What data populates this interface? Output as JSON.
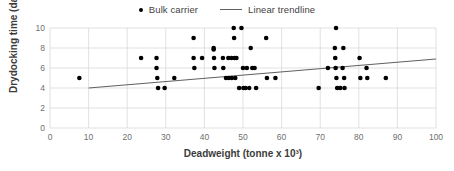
{
  "chart_data": {
    "type": "scatter",
    "title": "",
    "xlabel": "Deadweight (tonne x 10³)",
    "ylabel": "Drydocking time (day)",
    "xlim": [
      0,
      100
    ],
    "ylim": [
      0,
      10
    ],
    "xticks": [
      0,
      10,
      20,
      30,
      40,
      50,
      60,
      70,
      80,
      90,
      100
    ],
    "yticks": [
      0,
      2,
      4,
      6,
      8,
      10
    ],
    "grid": true,
    "legend_position": "top-center",
    "legend": [
      {
        "label": "Bulk carrier",
        "marker": "dot",
        "color": "#000000"
      },
      {
        "label": "Linear trendline",
        "marker": "line",
        "color": "#606060"
      }
    ],
    "series": [
      {
        "name": "Bulk carrier",
        "marker": "dot",
        "color": "#000000",
        "points": [
          [
            7.6,
            5
          ],
          [
            23.6,
            7
          ],
          [
            27.6,
            7
          ],
          [
            27.6,
            6
          ],
          [
            27.8,
            5
          ],
          [
            28.0,
            4
          ],
          [
            29.7,
            4
          ],
          [
            32.2,
            5
          ],
          [
            37.2,
            9
          ],
          [
            37.2,
            7
          ],
          [
            37.4,
            6
          ],
          [
            39.4,
            7
          ],
          [
            42.4,
            8
          ],
          [
            42.4,
            7.85
          ],
          [
            42.5,
            7
          ],
          [
            42.6,
            6
          ],
          [
            44.8,
            7
          ],
          [
            44.9,
            6
          ],
          [
            45.6,
            5
          ],
          [
            46.2,
            7
          ],
          [
            46.3,
            5
          ],
          [
            47.0,
            7
          ],
          [
            47.1,
            5
          ],
          [
            47.6,
            10
          ],
          [
            47.7,
            9
          ],
          [
            47.8,
            7
          ],
          [
            48.0,
            5
          ],
          [
            48.3,
            7
          ],
          [
            49.0,
            4
          ],
          [
            49.6,
            10
          ],
          [
            50.0,
            6
          ],
          [
            50.1,
            4
          ],
          [
            50.6,
            4
          ],
          [
            51.0,
            6
          ],
          [
            51.6,
            4
          ],
          [
            52.0,
            8
          ],
          [
            52.4,
            6
          ],
          [
            53.0,
            6
          ],
          [
            53.4,
            4
          ],
          [
            56.0,
            9
          ],
          [
            56.2,
            5
          ],
          [
            58.4,
            5
          ],
          [
            69.6,
            4
          ],
          [
            72.0,
            6
          ],
          [
            73.8,
            8
          ],
          [
            73.9,
            7
          ],
          [
            74.0,
            6
          ],
          [
            74.1,
            10
          ],
          [
            74.2,
            5
          ],
          [
            74.4,
            4
          ],
          [
            75.2,
            4
          ],
          [
            75.8,
            6
          ],
          [
            76.0,
            8
          ],
          [
            76.2,
            5
          ],
          [
            76.3,
            4
          ],
          [
            80.2,
            7
          ],
          [
            80.4,
            5
          ],
          [
            82.0,
            6
          ],
          [
            82.2,
            5
          ],
          [
            87.0,
            5
          ]
        ]
      }
    ],
    "trendline": {
      "name": "Linear trendline",
      "color": "#606060",
      "x_start": 10,
      "y_start": 4.0,
      "x_end": 100,
      "y_end": 6.9
    }
  }
}
